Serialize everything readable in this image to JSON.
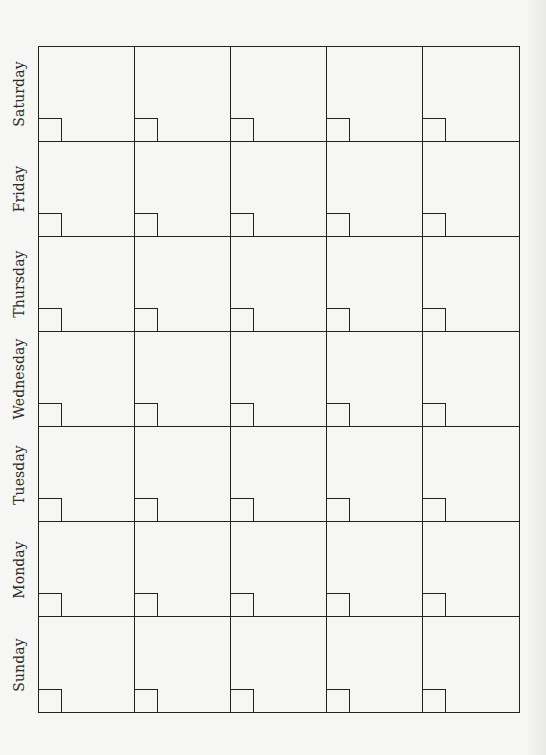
{
  "calendar": {
    "orientation": "rotated-90-ccw",
    "columns": 5,
    "rows": 7,
    "colors": {
      "background": "#f6f6f4",
      "line": "#222222",
      "text": "#2a2a2a"
    },
    "day_labels": [
      {
        "label": "Saturday"
      },
      {
        "label": "Friday"
      },
      {
        "label": "Thursday"
      },
      {
        "label": "Wednesday"
      },
      {
        "label": "Tuesday"
      },
      {
        "label": "Monday"
      },
      {
        "label": "Sunday"
      }
    ]
  }
}
